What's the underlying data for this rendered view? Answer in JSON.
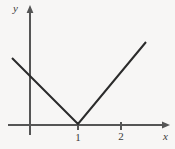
{
  "figure": {
    "name": "absolute-value-graph",
    "width": 175,
    "height": 149,
    "background_color": "#f7f6f5",
    "stroke_color": "#2b2b2b",
    "text_color": "#3a3a3a"
  },
  "axes": {
    "x_label": "x",
    "y_label": "y",
    "x_axis": {
      "y_px": 125,
      "x_start_px": 8,
      "x_end_px": 170,
      "arrow": "right"
    },
    "y_axis": {
      "x_px": 30,
      "y_start_px": 135,
      "y_end_px": 8,
      "arrow": "up"
    },
    "origin_px": {
      "x": 30,
      "y": 125
    },
    "unit_px": 48
  },
  "ticks": {
    "x": [
      {
        "label": "1",
        "x_px": 78
      },
      {
        "label": "2",
        "x_px": 121
      }
    ],
    "y": []
  },
  "chart_data": {
    "type": "line",
    "title": "",
    "subtitle": "",
    "xlabel": "x",
    "ylabel": "y",
    "grid": false,
    "legend": false,
    "xlim": [
      -0.4,
      2.9
    ],
    "ylim": [
      -0.1,
      2.5
    ],
    "xticks": [
      1,
      2
    ],
    "xticklabels": [
      "1",
      "2"
    ],
    "yticks": [],
    "yticklabels": [],
    "annotations": [],
    "series": [
      {
        "name": "y = |x - 1|",
        "type": "line",
        "color": "#2b2b2b",
        "linewidth": 2,
        "x": [
          -0.375,
          1.0,
          2.417
        ],
        "y": [
          1.396,
          0.0,
          1.729
        ],
        "points_px": [
          {
            "x": 12,
            "y": 58
          },
          {
            "x": 78,
            "y": 124
          },
          {
            "x": 146,
            "y": 42
          }
        ]
      }
    ]
  }
}
